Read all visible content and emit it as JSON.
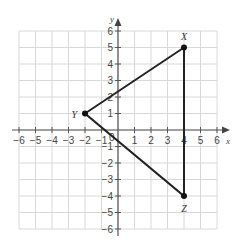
{
  "chart_data": {
    "type": "scatter",
    "title": "",
    "xlabel": "x",
    "ylabel": "y",
    "xlim": [
      -6,
      6
    ],
    "ylim": [
      -6,
      6
    ],
    "grid": true,
    "x_ticks": [
      -6,
      -5,
      -4,
      -3,
      -2,
      -1,
      1,
      2,
      3,
      4,
      5,
      6
    ],
    "y_ticks": [
      6,
      5,
      4,
      3,
      2,
      1,
      -1,
      -2,
      -3,
      -4,
      -5,
      -6
    ],
    "origin_label": "0",
    "points": [
      {
        "label": "X",
        "x": 4,
        "y": 5
      },
      {
        "label": "Y",
        "x": -2,
        "y": 1
      },
      {
        "label": "Z",
        "x": 4,
        "y": -4
      }
    ],
    "polygon": [
      "X",
      "Y",
      "Z"
    ],
    "shape": "triangle"
  },
  "labels": {
    "x_axis": "x",
    "y_axis": "y",
    "origin": "0",
    "X": "X",
    "Y": "Y",
    "Z": "Z"
  },
  "colors": {
    "grid": "#d8d8d8",
    "axis": "#555555",
    "edge": "#222222"
  }
}
